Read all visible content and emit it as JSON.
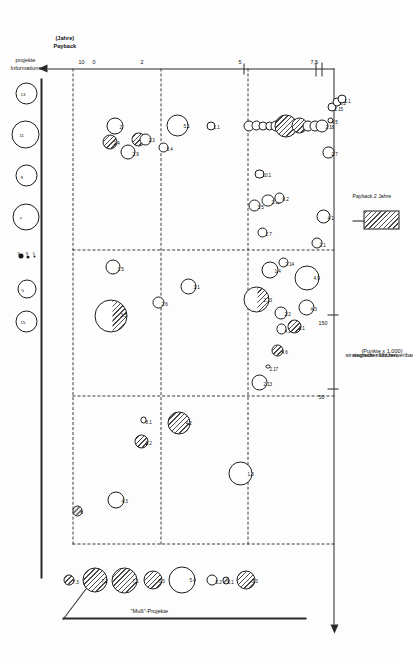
{
  "figure": {
    "orientation": "rotated-90",
    "background": "#fdfdfd",
    "ink": "#1b1b1b"
  },
  "axes": {
    "y_axis": {
      "label_line1": "strategischer Nutzen,",
      "label_line2": "monetär nicht bewertbar",
      "label_line3": "(Punkte x 1.000)",
      "ticks": [
        "150",
        "50"
      ],
      "tick_top": "150",
      "tick_mid": "50"
    },
    "x_axis": {
      "label_line1": "Payback",
      "label_line2": "(Jahre)",
      "ticks": [
        "10",
        "0",
        "5",
        "7,5",
        "2"
      ],
      "tick_ten": "10",
      "tick_zero": "0",
      "tick_five": "5",
      "tick_sevenfive": "7,5",
      "tick_two": "2"
    }
  },
  "annotations": {
    "must_projects": "\"Muß\"-Projekte",
    "info_projects_line1": "Informations-",
    "info_projects_line2": "projekte",
    "legend_hatch": "Payback 2 Jahre"
  },
  "size_key": {
    "items": [
      {
        "label": "13",
        "r": 5.0
      },
      {
        "label": "11",
        "r": 6.2
      },
      {
        "label": "9",
        "r": 4.6
      },
      {
        "label": "7",
        "r": 5.4
      },
      {
        "label": "3",
        "r": 2.0
      },
      {
        "label": "1",
        "r": 1.2
      },
      {
        "label": "5",
        "r": 3.6
      },
      {
        "label": "15",
        "r": 4.2
      }
    ],
    "dot_labels": [
      "5",
      "3",
      "1"
    ]
  },
  "chart_data": {
    "type": "scatter",
    "xlabel": "Payback (Jahre)",
    "ylabel": "strategischer Nutzen, monetär nicht bewertbar (Punkte x 1.000)",
    "xlim": [
      10,
      0
    ],
    "ylim": [
      0,
      170
    ],
    "grid": "dashed",
    "legend_position": "bottom-right",
    "note": "Bubble area encodes project effort; hatched fill = Payback 2 Jahre; labels are project IDs.",
    "bubbles": [
      {
        "id": "7.3",
        "x": 9.55,
        "y": 157,
        "r": 5.5,
        "fill": "hatch"
      },
      {
        "id": "7.2",
        "x": 9.55,
        "y": 142,
        "r": 12.5,
        "fill": "hatch"
      },
      {
        "id": "7.1",
        "x": 9.55,
        "y": 124,
        "r": 13.0,
        "fill": "hatch"
      },
      {
        "id": "5.3",
        "x": 9.55,
        "y": 107,
        "r": 9.5,
        "fill": "hatch"
      },
      {
        "id": "5.4",
        "x": 9.55,
        "y": 90,
        "r": 13.5,
        "fill": "open"
      },
      {
        "id": "5.2",
        "x": 9.55,
        "y": 72,
        "r": 5.5,
        "fill": "open"
      },
      {
        "id": "5.1",
        "x": 9.55,
        "y": 64,
        "r": 3.6,
        "fill": "hatch"
      },
      {
        "id": "3.3",
        "x": 9.55,
        "y": 52,
        "r": 9.5,
        "fill": "hatch"
      },
      {
        "id": "6",
        "x": 8.25,
        "y": 152,
        "r": 5.2,
        "fill": "hatch"
      },
      {
        "id": "4.3",
        "x": 8.05,
        "y": 129,
        "r": 8.5,
        "fill": "open"
      },
      {
        "id": "2.2",
        "x": 6.95,
        "y": 114,
        "r": 7.0,
        "fill": "hatch"
      },
      {
        "id": "8.1",
        "x": 6.55,
        "y": 113,
        "r": 3.2,
        "fill": "open"
      },
      {
        "id": "4.2",
        "x": 6.6,
        "y": 92,
        "r": 11.5,
        "fill": "hatch"
      },
      {
        "id": "1.3",
        "x": 7.55,
        "y": 55,
        "r": 12.0,
        "fill": "open"
      },
      {
        "id": "3.3b",
        "x": 4.6,
        "y": 132,
        "r": 16.5,
        "fill": "half"
      },
      {
        "id": "1.5",
        "x": 3.7,
        "y": 131,
        "r": 7.5,
        "fill": "open"
      },
      {
        "id": "2.6",
        "x": 4.35,
        "y": 104,
        "r": 6.0,
        "fill": "open"
      },
      {
        "id": "3.1",
        "x": 4.05,
        "y": 86,
        "r": 8.0,
        "fill": "open"
      },
      {
        "id": "2.4",
        "x": 1.35,
        "y": 133,
        "r": 7.5,
        "fill": "hatch"
      },
      {
        "id": "2",
        "x": 1.05,
        "y": 130,
        "r": 8.5,
        "fill": "open"
      },
      {
        "id": "2.9",
        "x": 1.55,
        "y": 122,
        "r": 7.5,
        "fill": "open"
      },
      {
        "id": "2.10",
        "x": 1.3,
        "y": 116,
        "r": 7.0,
        "fill": "hatch"
      },
      {
        "id": "2.3",
        "x": 1.3,
        "y": 112,
        "r": 6.0,
        "fill": "open"
      },
      {
        "id": "3.4",
        "x": 1.45,
        "y": 101,
        "r": 5.0,
        "fill": "open"
      },
      {
        "id": "5.1b",
        "x": 1.05,
        "y": 93,
        "r": 11.0,
        "fill": "open"
      },
      {
        "id": "1.1",
        "x": 1.05,
        "y": 73,
        "r": 4.6,
        "fill": "open"
      },
      {
        "id": "2.13",
        "x": 5.85,
        "y": 44,
        "r": 8.0,
        "fill": "open"
      },
      {
        "id": "2.17",
        "x": 5.55,
        "y": 39,
        "r": 2.2,
        "fill": "open"
      },
      {
        "id": "4.6",
        "x": 5.25,
        "y": 33,
        "r": 6.0,
        "fill": "hatch"
      },
      {
        "id": "4.2b",
        "x": 4.85,
        "y": 31,
        "r": 5.2,
        "fill": "open"
      },
      {
        "id": "2.2b",
        "x": 4.55,
        "y": 31,
        "r": 6.5,
        "fill": "open"
      },
      {
        "id": "2.1",
        "x": 4.8,
        "y": 23,
        "r": 7.0,
        "fill": "hatch"
      },
      {
        "id": "4.3b",
        "x": 4.45,
        "y": 16,
        "r": 8.0,
        "fill": "open"
      },
      {
        "id": "4.9",
        "x": 3.9,
        "y": 16,
        "r": 12.5,
        "fill": "open"
      },
      {
        "id": "2.1b",
        "x": 3.25,
        "y": 10,
        "r": 5.5,
        "fill": "open"
      },
      {
        "id": "4.1",
        "x": 2.75,
        "y": 6,
        "r": 7.0,
        "fill": "open"
      },
      {
        "id": "2.13b",
        "x": 4.3,
        "y": 46,
        "r": 13.0,
        "fill": "half"
      },
      {
        "id": "1.4",
        "x": 3.75,
        "y": 38,
        "r": 8.5,
        "fill": "open"
      },
      {
        "id": "2.14",
        "x": 3.6,
        "y": 30,
        "r": 5.0,
        "fill": "open"
      },
      {
        "id": "2.7",
        "x": 3.05,
        "y": 42,
        "r": 5.0,
        "fill": "open"
      },
      {
        "id": "3.5",
        "x": 2.55,
        "y": 47,
        "r": 6.0,
        "fill": "open"
      },
      {
        "id": "2.12",
        "x": 2.45,
        "y": 39,
        "r": 6.2,
        "fill": "open"
      },
      {
        "id": "8.2",
        "x": 2.4,
        "y": 32,
        "r": 5.2,
        "fill": "open"
      },
      {
        "id": "10.1",
        "x": 1.95,
        "y": 44,
        "r": 4.6,
        "fill": "open"
      },
      {
        "id": "2.11",
        "x": 1.05,
        "y": 50,
        "r": 5.6,
        "fill": "open"
      },
      {
        "id": "1.6",
        "x": 1.05,
        "y": 46,
        "r": 5.0,
        "fill": "open"
      },
      {
        "id": "4.10",
        "x": 1.05,
        "y": 42,
        "r": 4.4,
        "fill": "open"
      },
      {
        "id": "3.10",
        "x": 1.05,
        "y": 38,
        "r": 4.4,
        "fill": "open"
      },
      {
        "id": "4.7",
        "x": 1.05,
        "y": 34,
        "r": 5.6,
        "fill": "open"
      },
      {
        "id": "3.9",
        "x": 1.05,
        "y": 28,
        "r": 11.5,
        "fill": "hatch"
      },
      {
        "id": "3.8",
        "x": 1.05,
        "y": 20,
        "r": 8.0,
        "fill": "hatch"
      },
      {
        "id": "2.9b",
        "x": 1.05,
        "y": 15,
        "r": 5.6,
        "fill": "open"
      },
      {
        "id": "3.6",
        "x": 1.05,
        "y": 11,
        "r": 5.6,
        "fill": "open"
      },
      {
        "id": "2.18",
        "x": 1.05,
        "y": 7,
        "r": 6.6,
        "fill": "open"
      },
      {
        "id": "2.7b",
        "x": 1.55,
        "y": 3,
        "r": 5.6,
        "fill": "open"
      },
      {
        "id": "4.5",
        "x": 0.95,
        "y": 2,
        "r": 3.0,
        "fill": "open"
      },
      {
        "id": "2.15",
        "x": 0.7,
        "y": 1,
        "r": 4.6,
        "fill": "open"
      },
      {
        "id": "1.2",
        "x": 0.6,
        "y": -2,
        "r": 4.6,
        "fill": "open"
      },
      {
        "id": "1.1b",
        "x": 0.55,
        "y": -5,
        "r": 4.6,
        "fill": "open"
      }
    ]
  }
}
